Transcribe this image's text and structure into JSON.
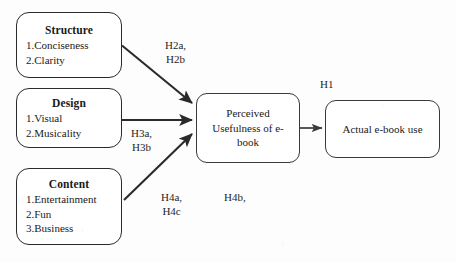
{
  "figure": {
    "type": "conceptual-research-model",
    "background_color": "#fdfdfd",
    "line_color": "#2a2a2a"
  },
  "nodes": {
    "structure": {
      "title": "Structure",
      "items": [
        "1.Conciseness",
        "2.Clarity"
      ]
    },
    "design": {
      "title": "Design",
      "items": [
        "1.Visual",
        "2.Musicality"
      ]
    },
    "content": {
      "title": "Content",
      "items": [
        "1.Entertainment",
        "2.Fun",
        "3.Business"
      ]
    },
    "perceived_usefulness": {
      "label": "Perceived Usefulness of e-book"
    },
    "actual_use": {
      "label": "Actual e-book use"
    }
  },
  "hypotheses": {
    "h2": "H2a,\nH2b",
    "h3": "H3a,\nH3b",
    "h4_left": "H4a,\nH4c",
    "h4_right": "H4b,",
    "h1": "H1"
  }
}
